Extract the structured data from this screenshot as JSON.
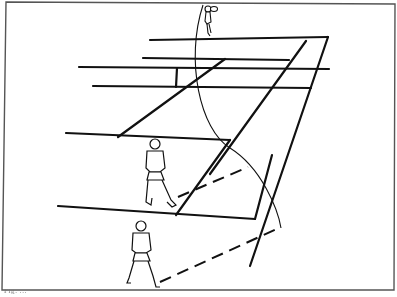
{
  "figure": {
    "colors": {
      "ink": "#111111",
      "frame": "#555555",
      "background": "#ffffff"
    },
    "elements": {
      "frame": "bordered figure frame",
      "court_lines": "court baseline, service lines, sidelines and net",
      "arc": "coverage arc",
      "dashed_lines": [
        "angle line from near-court player",
        "angle line from baseline player"
      ],
      "players": [
        "far player (serving)",
        "net-area player",
        "baseline player"
      ]
    }
  },
  "caption": {
    "text": "Fig. ..."
  }
}
